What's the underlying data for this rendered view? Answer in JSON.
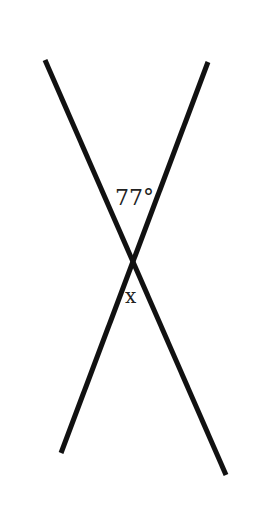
{
  "diagram": {
    "type": "intersecting-lines",
    "lines": [
      {
        "name": "line-a",
        "direction": "top-left to bottom-right"
      },
      {
        "name": "line-b",
        "direction": "top-right to bottom-left"
      }
    ],
    "labels": {
      "given_angle": "77°",
      "unknown_angle": "x"
    },
    "colors": {
      "line": "#111111",
      "text": "#222222",
      "background": "#ffffff"
    }
  }
}
